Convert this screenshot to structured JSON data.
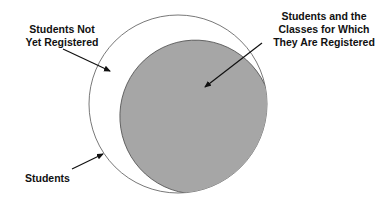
{
  "diagram": {
    "type": "venn",
    "colors": {
      "outer_fill": "#ffffff",
      "outer_stroke": "#555555",
      "inner_fill": "#a6a6a6",
      "inner_stroke": "#555555",
      "text": "#111111"
    },
    "labels": {
      "not_registered_line1": "Students Not",
      "not_registered_line2": "Yet Registered",
      "classes_line1": "Students and the",
      "classes_line2": "Classes for Which",
      "classes_line3": "They Are Registered",
      "students": "Students"
    },
    "sets": [
      {
        "name": "Students",
        "role": "outer circle"
      },
      {
        "name": "Students and the Classes for Which They Are Registered",
        "role": "shaded subset"
      },
      {
        "name": "Students Not Yet Registered",
        "role": "unshaded region"
      }
    ]
  }
}
